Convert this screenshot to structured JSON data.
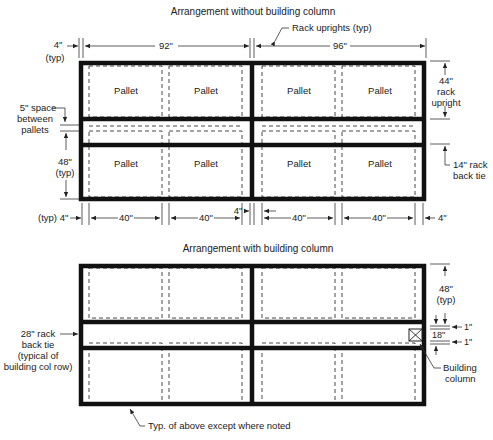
{
  "top_diagram": {
    "title": "Arrangement without building column",
    "pallet_label": "Pallet",
    "pallets": [
      "Pallet",
      "Pallet",
      "Pallet",
      "Pallet",
      "Pallet",
      "Pallet",
      "Pallet",
      "Pallet"
    ],
    "callouts": {
      "rack_uprights": "Rack uprights (typ)",
      "upright_gap_val": "4\"",
      "upright_gap_typ": "(typ)",
      "bay_left": "92\"",
      "bay_right": "96\"",
      "pallet_space_1": "5\" space",
      "pallet_space_2": "between",
      "pallet_space_3": "pallets",
      "depth_val": "48\"",
      "depth_typ": "(typ)",
      "rack_upright_val": "44\"",
      "rack_upright_1": "rack",
      "rack_upright_2": "upright",
      "back_tie_1": "14\" rack",
      "back_tie_2": "back tie"
    },
    "bottom_dims": {
      "left_typ": "(typ) 4\"",
      "p1": "40\"",
      "p2": "40\"",
      "center_gap": "4\"",
      "p3": "40\"",
      "p4": "40\"",
      "right": "4\""
    }
  },
  "bottom_diagram": {
    "title": "Arrangement with building column",
    "callouts": {
      "depth_val": "48\"",
      "depth_typ": "(typ)",
      "clear_top": "1\"",
      "column_size": "18\"",
      "clear_bottom": "1\"",
      "building_column_1": "Building",
      "building_column_2": "column",
      "back_tie_1": "28\" rack",
      "back_tie_2": "back tie",
      "back_tie_3": "(typical of",
      "back_tie_4": "building col row)",
      "note": "Typ. of above except where noted"
    }
  }
}
